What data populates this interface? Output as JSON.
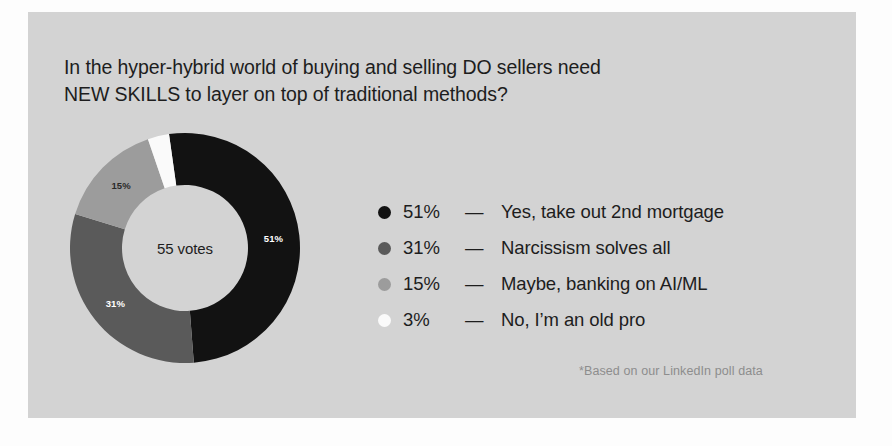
{
  "card": {
    "background_color": "#d3d3d3",
    "title": "In the hyper-hybrid world of buying and selling DO sellers need\nNEW SKILLS to layer on top of traditional methods?",
    "footnote": "*Based on our LinkedIn poll data"
  },
  "chart_data": {
    "type": "pie",
    "variant": "donut",
    "title": "In the hyper-hybrid world of buying and selling DO sellers need NEW SKILLS to layer on top of traditional methods?",
    "center_label": "55 votes",
    "total_votes": 55,
    "unit": "%",
    "start_angle_deg": -8,
    "legend_position": "right",
    "grid": false,
    "categories": [
      "Yes, take out 2nd mortgage",
      "Narcissism solves all",
      "Maybe, banking on AI/ML",
      "No, I'm an old pro"
    ],
    "values": [
      51,
      31,
      15,
      3
    ],
    "value_labels": [
      "51%",
      "31%",
      "15%",
      "3%"
    ],
    "colors": [
      "#121212",
      "#5a5a5a",
      "#9c9c9c",
      "#fafafa"
    ],
    "slice_label_colors": [
      "#ffffff",
      "#ffffff",
      "#2a2a2a",
      "#2a2a2a"
    ],
    "slices": [
      {
        "label": "Yes, take out 2nd mortgage",
        "value": 51,
        "value_label": "51%",
        "color": "#121212",
        "show_slice_label": true
      },
      {
        "label": "Narcissism solves all",
        "value": 31,
        "value_label": "31%",
        "color": "#5a5a5a",
        "show_slice_label": true
      },
      {
        "label": "Maybe, banking on AI/ML",
        "value": 15,
        "value_label": "15%",
        "color": "#9c9c9c",
        "show_slice_label": true
      },
      {
        "label": "No, I'm an old pro",
        "value": 3,
        "value_label": "3%",
        "color": "#fafafa",
        "show_slice_label": false
      }
    ],
    "legend": [
      {
        "value_label": "51%",
        "dash": "—",
        "label": "Yes, take out 2nd mortgage",
        "color": "#121212"
      },
      {
        "value_label": "31%",
        "dash": "—",
        "label": "Narcissism solves all",
        "color": "#5a5a5a"
      },
      {
        "value_label": "15%",
        "dash": "—",
        "label": "Maybe, banking on AI/ML",
        "color": "#9c9c9c"
      },
      {
        "value_label": "3%",
        "dash": "—",
        "label": "No, I’m an old pro",
        "color": "#fafafa"
      }
    ]
  }
}
